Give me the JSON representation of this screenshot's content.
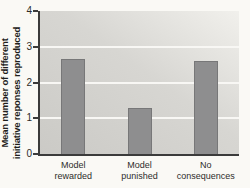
{
  "figure": {
    "background": "#faf9f5",
    "plot_bg_from": "#cbcac6",
    "plot_bg_to": "#f1f0ec",
    "bar_color": "#8e8e8f",
    "grid_color": "#f8f7f4",
    "axis_color": "#3b3b3b",
    "text_color": "#2e2d2b"
  },
  "chart_data": {
    "type": "bar",
    "title": "",
    "xlabel": "",
    "ylabel": "Mean number of different initiative reponses reproduced",
    "ylabel_lines": [
      "Mean number of different",
      "initiative reponses reproduced"
    ],
    "categories": [
      "Model rewarded",
      "Model punished",
      "No consequences"
    ],
    "category_lines": [
      [
        "Model",
        "rewarded"
      ],
      [
        "Model",
        "punished"
      ],
      [
        "No",
        "consequences"
      ]
    ],
    "values": [
      2.65,
      1.3,
      2.6
    ],
    "ylim": [
      0,
      4
    ],
    "yticks": [
      0,
      1,
      2,
      3,
      4
    ],
    "gridlines": [
      1,
      2,
      3
    ],
    "grid": true,
    "legend_position": "none"
  }
}
